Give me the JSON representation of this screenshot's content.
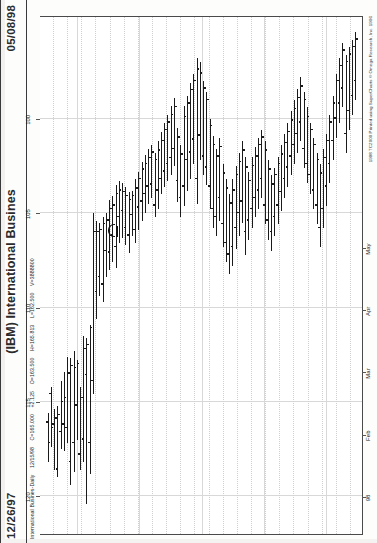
{
  "window": {
    "title": "(IBM) International Busines",
    "date_left": "12/26/97",
    "date_right": "05/08/98"
  },
  "quote": {
    "symbol_line": "International Busines-Daily",
    "quote_date": "12/15/98",
    "close_label": "C=165.000",
    "change_label": "+2.125",
    "open_label": "O=163.500",
    "high_label": "H=165.813",
    "low_label": "L=162.500",
    "volume_label": "V=3888800"
  },
  "copyright": "1998 TC2000 Printed using SuperCharts © Omega Research, Inc. 1996",
  "chart_data": {
    "type": "bar",
    "title": "(IBM) International Busines",
    "subtitle": "International Busines-Daily",
    "orientation": "rotated-90-ccw",
    "xlabel": "",
    "ylabel": "Price",
    "grid": true,
    "legend": "none",
    "price_axis": {
      "ticks": [
        120,
        115,
        110,
        105,
        100
      ],
      "min": 94.5,
      "max": 122.0
    },
    "time_axis": {
      "ticks": [
        "98",
        "Feb",
        "Mar",
        "Apr",
        "May"
      ],
      "start": "12/26/97",
      "end": "05/08/98"
    },
    "bars": [
      {
        "i": 0,
        "high": 118.2,
        "low": 115.6,
        "open": 116.1,
        "close": 117.2
      },
      {
        "i": 1,
        "high": 117.4,
        "low": 114.2,
        "open": 114.6,
        "close": 116.4
      },
      {
        "i": 2,
        "high": 118.6,
        "low": 115.4,
        "open": 116.2,
        "close": 115.9
      },
      {
        "i": 3,
        "high": 119.0,
        "low": 115.2,
        "open": 118.6,
        "close": 115.7
      },
      {
        "i": 4,
        "high": 117.5,
        "low": 113.9,
        "open": 116.6,
        "close": 115.0
      },
      {
        "i": 5,
        "high": 117.6,
        "low": 113.4,
        "open": 116.2,
        "close": 114.8
      },
      {
        "i": 6,
        "high": 117.2,
        "low": 112.6,
        "open": 116.4,
        "close": 113.5
      },
      {
        "i": 7,
        "high": 119.4,
        "low": 112.7,
        "open": 118.2,
        "close": 113.1
      },
      {
        "i": 8,
        "high": 118.7,
        "low": 112.3,
        "open": 117.2,
        "close": 113.2
      },
      {
        "i": 9,
        "high": 117.0,
        "low": 112.8,
        "open": 115.2,
        "close": 113.0
      },
      {
        "i": 10,
        "high": 118.6,
        "low": 114.2,
        "open": 117.8,
        "close": 114.8
      },
      {
        "i": 11,
        "high": 118.2,
        "low": 111.5,
        "open": 117.0,
        "close": 112.2
      },
      {
        "i": 12,
        "high": 120.4,
        "low": 111.6,
        "open": 113.6,
        "close": 112.0
      },
      {
        "i": 13,
        "high": 118.8,
        "low": 110.9,
        "open": 117.2,
        "close": 111.1
      },
      {
        "i": 14,
        "high": 114.6,
        "low": 105.0,
        "open": 113.9,
        "close": 106.0
      },
      {
        "i": 15,
        "high": 110.6,
        "low": 105.4,
        "open": 109.2,
        "close": 106.0
      },
      {
        "i": 16,
        "high": 109.4,
        "low": 105.5,
        "open": 108.4,
        "close": 105.9
      },
      {
        "i": 17,
        "high": 109.7,
        "low": 105.2,
        "open": 108.8,
        "close": 105.6
      },
      {
        "i": 18,
        "high": 108.4,
        "low": 105.0,
        "open": 107.0,
        "close": 105.4
      },
      {
        "i": 19,
        "high": 108.0,
        "low": 104.3,
        "open": 107.1,
        "close": 104.8
      },
      {
        "i": 20,
        "high": 107.6,
        "low": 104.1,
        "open": 106.2,
        "close": 104.6
      },
      {
        "i": 21,
        "high": 107.9,
        "low": 103.5,
        "open": 106.8,
        "close": 104.0
      },
      {
        "i": 22,
        "high": 106.6,
        "low": 103.3,
        "open": 105.2,
        "close": 103.8
      },
      {
        "i": 23,
        "high": 106.3,
        "low": 103.4,
        "open": 104.9,
        "close": 103.9
      },
      {
        "i": 24,
        "high": 106.7,
        "low": 103.6,
        "open": 105.8,
        "close": 104.1
      },
      {
        "i": 25,
        "high": 107.1,
        "low": 103.9,
        "open": 106.2,
        "close": 104.3
      },
      {
        "i": 26,
        "high": 106.2,
        "low": 103.8,
        "open": 105.1,
        "close": 104.1
      },
      {
        "i": 27,
        "high": 106.6,
        "low": 103.2,
        "open": 105.9,
        "close": 103.7
      },
      {
        "i": 28,
        "high": 105.9,
        "low": 102.8,
        "open": 104.7,
        "close": 103.2
      },
      {
        "i": 29,
        "high": 105.4,
        "low": 102.3,
        "open": 104.4,
        "close": 102.7
      },
      {
        "i": 30,
        "high": 105.0,
        "low": 101.9,
        "open": 104.0,
        "close": 102.4
      },
      {
        "i": 31,
        "high": 104.5,
        "low": 101.6,
        "open": 103.6,
        "close": 102.1
      },
      {
        "i": 32,
        "high": 104.2,
        "low": 101.4,
        "open": 103.5,
        "close": 101.8
      },
      {
        "i": 33,
        "high": 105.2,
        "low": 101.8,
        "open": 104.6,
        "close": 102.2
      },
      {
        "i": 34,
        "high": 104.8,
        "low": 101.2,
        "open": 103.8,
        "close": 101.7
      },
      {
        "i": 35,
        "high": 104.0,
        "low": 100.7,
        "open": 103.2,
        "close": 101.2
      },
      {
        "i": 36,
        "high": 103.6,
        "low": 100.2,
        "open": 102.8,
        "close": 100.6
      },
      {
        "i": 37,
        "high": 103.3,
        "low": 99.8,
        "open": 102.4,
        "close": 100.2
      },
      {
        "i": 38,
        "high": 103.0,
        "low": 99.3,
        "open": 102.1,
        "close": 99.8
      },
      {
        "i": 39,
        "high": 102.5,
        "low": 98.9,
        "open": 101.6,
        "close": 99.4
      },
      {
        "i": 40,
        "high": 104.4,
        "low": 100.5,
        "open": 103.3,
        "close": 101.0
      },
      {
        "i": 41,
        "high": 105.2,
        "low": 101.4,
        "open": 104.2,
        "close": 101.9
      },
      {
        "i": 42,
        "high": 104.6,
        "low": 99.3,
        "open": 103.6,
        "close": 99.9
      },
      {
        "i": 43,
        "high": 103.8,
        "low": 98.8,
        "open": 102.2,
        "close": 99.2
      },
      {
        "i": 44,
        "high": 103.2,
        "low": 98.1,
        "open": 101.8,
        "close": 98.5
      },
      {
        "i": 45,
        "high": 102.4,
        "low": 97.6,
        "open": 101.1,
        "close": 98.0
      },
      {
        "i": 46,
        "high": 104.5,
        "low": 96.8,
        "open": 103.2,
        "close": 97.4
      },
      {
        "i": 47,
        "high": 102.2,
        "low": 97.0,
        "open": 100.9,
        "close": 97.6
      },
      {
        "i": 48,
        "high": 103.0,
        "low": 98.0,
        "open": 102.0,
        "close": 98.4
      },
      {
        "i": 49,
        "high": 103.5,
        "low": 98.6,
        "open": 102.6,
        "close": 99.0
      },
      {
        "i": 50,
        "high": 104.8,
        "low": 100.0,
        "open": 103.6,
        "close": 100.4
      },
      {
        "i": 51,
        "high": 105.8,
        "low": 100.9,
        "open": 104.8,
        "close": 101.4
      },
      {
        "i": 52,
        "high": 106.2,
        "low": 101.6,
        "open": 105.2,
        "close": 102.0
      },
      {
        "i": 53,
        "high": 105.4,
        "low": 101.0,
        "open": 104.2,
        "close": 101.5
      },
      {
        "i": 54,
        "high": 106.8,
        "low": 102.4,
        "open": 105.6,
        "close": 102.9
      },
      {
        "i": 55,
        "high": 107.6,
        "low": 103.2,
        "open": 106.6,
        "close": 103.7
      },
      {
        "i": 56,
        "high": 108.2,
        "low": 104.0,
        "open": 107.2,
        "close": 104.5
      },
      {
        "i": 57,
        "high": 107.8,
        "low": 103.2,
        "open": 106.8,
        "close": 103.8
      },
      {
        "i": 58,
        "high": 106.9,
        "low": 102.5,
        "open": 105.8,
        "close": 103.0
      },
      {
        "i": 59,
        "high": 106.2,
        "low": 101.8,
        "open": 105.0,
        "close": 102.3
      },
      {
        "i": 60,
        "high": 105.5,
        "low": 101.2,
        "open": 104.4,
        "close": 101.7
      },
      {
        "i": 61,
        "high": 107.2,
        "low": 102.0,
        "open": 106.0,
        "close": 102.6
      },
      {
        "i": 62,
        "high": 106.4,
        "low": 102.8,
        "open": 105.4,
        "close": 103.3
      },
      {
        "i": 63,
        "high": 105.8,
        "low": 102.0,
        "open": 104.8,
        "close": 102.5
      },
      {
        "i": 64,
        "high": 105.2,
        "low": 101.5,
        "open": 104.2,
        "close": 102.0
      },
      {
        "i": 65,
        "high": 104.8,
        "low": 101.0,
        "open": 103.8,
        "close": 101.4
      },
      {
        "i": 66,
        "high": 104.2,
        "low": 100.6,
        "open": 103.2,
        "close": 101.0
      },
      {
        "i": 67,
        "high": 105.6,
        "low": 101.2,
        "open": 104.6,
        "close": 101.7
      },
      {
        "i": 68,
        "high": 106.4,
        "low": 102.2,
        "open": 105.4,
        "close": 102.7
      },
      {
        "i": 69,
        "high": 107.0,
        "low": 103.0,
        "open": 106.0,
        "close": 103.5
      },
      {
        "i": 70,
        "high": 106.2,
        "low": 102.6,
        "open": 105.2,
        "close": 103.0
      },
      {
        "i": 71,
        "high": 105.6,
        "low": 102.0,
        "open": 104.6,
        "close": 102.4
      },
      {
        "i": 72,
        "high": 104.9,
        "low": 101.4,
        "open": 103.9,
        "close": 101.9
      },
      {
        "i": 73,
        "high": 104.2,
        "low": 100.8,
        "open": 103.2,
        "close": 101.3
      },
      {
        "i": 74,
        "high": 103.6,
        "low": 100.2,
        "open": 102.6,
        "close": 100.7
      },
      {
        "i": 75,
        "high": 103.0,
        "low": 99.6,
        "open": 102.0,
        "close": 100.1
      },
      {
        "i": 76,
        "high": 102.4,
        "low": 99.0,
        "open": 101.4,
        "close": 99.5
      },
      {
        "i": 77,
        "high": 101.8,
        "low": 98.4,
        "open": 100.8,
        "close": 98.9
      },
      {
        "i": 78,
        "high": 101.2,
        "low": 97.8,
        "open": 100.2,
        "close": 98.3
      },
      {
        "i": 79,
        "high": 102.6,
        "low": 98.6,
        "open": 101.6,
        "close": 99.0
      },
      {
        "i": 80,
        "high": 103.4,
        "low": 99.4,
        "open": 102.4,
        "close": 99.9
      },
      {
        "i": 81,
        "high": 104.0,
        "low": 100.2,
        "open": 103.0,
        "close": 100.6
      },
      {
        "i": 82,
        "high": 104.8,
        "low": 101.0,
        "open": 103.8,
        "close": 101.4
      },
      {
        "i": 83,
        "high": 105.6,
        "low": 101.8,
        "open": 104.6,
        "close": 102.2
      },
      {
        "i": 84,
        "high": 106.8,
        "low": 102.4,
        "open": 105.8,
        "close": 102.9
      },
      {
        "i": 85,
        "high": 105.8,
        "low": 101.6,
        "open": 104.8,
        "close": 102.1
      },
      {
        "i": 86,
        "high": 104.6,
        "low": 100.8,
        "open": 103.6,
        "close": 101.2
      },
      {
        "i": 87,
        "high": 103.4,
        "low": 99.8,
        "open": 102.4,
        "close": 100.2
      },
      {
        "i": 88,
        "high": 102.2,
        "low": 98.8,
        "open": 101.2,
        "close": 99.2
      },
      {
        "i": 89,
        "high": 101.0,
        "low": 97.6,
        "open": 100.0,
        "close": 98.0
      },
      {
        "i": 90,
        "high": 100.2,
        "low": 96.8,
        "open": 99.2,
        "close": 97.2
      },
      {
        "i": 91,
        "high": 99.4,
        "low": 96.0,
        "open": 98.4,
        "close": 96.4
      },
      {
        "i": 92,
        "high": 101.8,
        "low": 96.6,
        "open": 100.8,
        "close": 97.0
      },
      {
        "i": 93,
        "high": 100.6,
        "low": 96.2,
        "open": 99.6,
        "close": 96.6
      },
      {
        "i": 94,
        "high": 99.8,
        "low": 95.8,
        "open": 98.8,
        "close": 96.2
      },
      {
        "i": 95,
        "high": 99.0,
        "low": 95.4,
        "open": 98.0,
        "close": 95.8
      }
    ],
    "cursor": {
      "price": 106.0,
      "label": "crosshair-marker"
    }
  }
}
